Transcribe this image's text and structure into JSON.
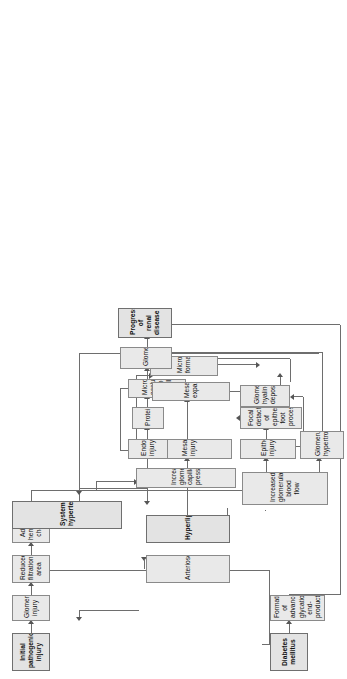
{
  "figure": {
    "orientation": "rotated-90-ccw",
    "box_fill": "#e9e9e9",
    "box_border": "#8a8a8a",
    "line_color": "#6e6e6e",
    "background": "#ffffff"
  },
  "nodes": {
    "initial_pathogenic_injury": "Initial pathogenic injury",
    "glomerular_injury": "Glomerular injury",
    "reduced_filtration_area": "Reduced filtration area",
    "adaptive_hemodynamic_changes": "Adaptive hemodynamic changes",
    "diabetes_mellitus": "Diabetes mellitus",
    "formation_of_age": "Formation of advanced glycation end-products",
    "increased_glomerular_blood_flow": "Increased glomerular blood flow",
    "increased_glomerular_capillary_pressure": "Increased glomerular capillary pressure",
    "glomerular_hypertrophy": "Glomerular hypertrophy",
    "epithelial_injury": "Epithelial injury",
    "focal_detachment": "Focal detachment of epithelial foot processes",
    "glomerular_hyaline_deposition": "Glomerular hyaline deposition",
    "endothelial_injury": "Endothelial injury",
    "proteinuria": "Proteinuria",
    "microthrombi": "Microthrombi occluding glomerular capillaries",
    "mesangial_injury": "Mesangial injury",
    "mesangial_expansion": "Mesangial expansion",
    "microaneurysm_formation": "Microaneurysm formation",
    "glomerulosclerosis": "Glomerulosclerosis",
    "progression_of_renal_disease": "Progression of renal disease",
    "systemic_hypertension": "Systemic hypertension",
    "arteriosclerosis": "Arteriosclerosis",
    "hyperlipidemia": "Hyperlipidemia"
  },
  "emphasized_nodes": [
    "Initial pathogenic injury",
    "Diabetes mellitus",
    "Systemic hypertension",
    "Hyperlipidemia",
    "Progression of renal disease"
  ],
  "edges": [
    {
      "from": "Initial pathogenic injury",
      "to": "Glomerular injury"
    },
    {
      "from": "Glomerular injury",
      "to": "Reduced filtration area"
    },
    {
      "from": "Reduced filtration area",
      "to": "Adaptive hemodynamic changes"
    },
    {
      "from": "Adaptive hemodynamic changes",
      "to": "Increased glomerular blood flow"
    },
    {
      "from": "Adaptive hemodynamic changes",
      "to": "Increased glomerular capillary pressure"
    },
    {
      "from": "Diabetes mellitus",
      "to": "Formation of advanced glycation end-products"
    },
    {
      "from": "Diabetes mellitus",
      "to": "Reduced filtration area"
    },
    {
      "from": "Formation of advanced glycation end-products",
      "to": "Progression of renal disease"
    },
    {
      "from": "Increased glomerular blood flow",
      "to": "Epithelial injury"
    },
    {
      "from": "Increased glomerular blood flow",
      "to": "Glomerular hypertrophy"
    },
    {
      "from": "Increased glomerular blood flow",
      "to": "Increased glomerular capillary pressure"
    },
    {
      "from": "Increased glomerular capillary pressure",
      "to": "Endothelial injury"
    },
    {
      "from": "Increased glomerular capillary pressure",
      "to": "Mesangial injury"
    },
    {
      "from": "Glomerular hypertrophy",
      "to": "Glomerulosclerosis"
    },
    {
      "from": "Epithelial injury",
      "to": "Focal detachment of epithelial foot processes"
    },
    {
      "from": "Focal detachment of epithelial foot processes",
      "to": "Proteinuria"
    },
    {
      "from": "Glomerular hyaline deposition",
      "to": "Glomerulosclerosis"
    },
    {
      "from": "Epithelial injury",
      "to": "Glomerular hyaline deposition"
    },
    {
      "from": "Endothelial injury",
      "to": "Proteinuria"
    },
    {
      "from": "Proteinuria",
      "to": "Microthrombi occluding glomerular capillaries"
    },
    {
      "from": "Endothelial injury",
      "to": "Microthrombi occluding glomerular capillaries"
    },
    {
      "from": "Microthrombi occluding glomerular capillaries",
      "to": "Glomerulosclerosis"
    },
    {
      "from": "Mesangial injury",
      "to": "Mesangial expansion"
    },
    {
      "from": "Mesangial injury",
      "to": "Microaneurysm formation"
    },
    {
      "from": "Mesangial expansion",
      "to": "Glomerulosclerosis"
    },
    {
      "from": "Microaneurysm formation",
      "to": "Glomerulosclerosis"
    },
    {
      "from": "Glomerulosclerosis",
      "to": "Progression of renal disease"
    },
    {
      "from": "Progression of renal disease",
      "to": "Systemic hypertension"
    },
    {
      "from": "Systemic hypertension",
      "to": "Arteriosclerosis"
    },
    {
      "from": "Systemic hypertension",
      "to": "Increased glomerular capillary pressure"
    },
    {
      "from": "Arteriosclerosis",
      "to": "Reduced filtration area"
    },
    {
      "from": "Hyperlipidemia",
      "to": "Mesangial injury"
    }
  ]
}
